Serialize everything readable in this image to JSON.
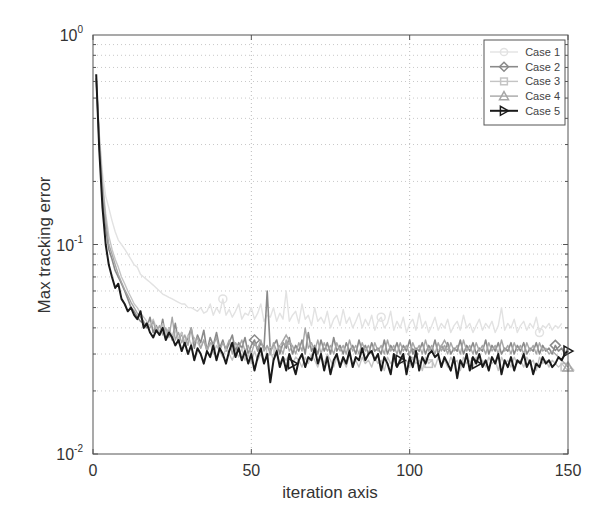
{
  "chart_data": {
    "type": "line",
    "title": "",
    "xlabel": "iteration axis",
    "ylabel": "Max tracking error",
    "xlim": [
      0,
      150
    ],
    "ylim": [
      0.01,
      1
    ],
    "yscale": "log",
    "grid": true,
    "legend_position": "upper right",
    "x_ticks": [
      0,
      50,
      100,
      150
    ],
    "x_tick_labels": [
      "0",
      "50",
      "100",
      "150"
    ],
    "y_ticks": [
      0.01,
      0.1,
      1
    ],
    "y_tick_labels": [
      {
        "base": "10",
        "exp": "-2"
      },
      {
        "base": "10",
        "exp": "-1"
      },
      {
        "base": "10",
        "exp": "0"
      }
    ],
    "legend": [
      "Case 1",
      "Case 2",
      "Case 3",
      "Case 4",
      "Case 5"
    ],
    "series": [
      {
        "name": "Case 1",
        "color": "#e2e2e2",
        "marker": "circle",
        "width": 1.4,
        "values": [
          0.62,
          0.34,
          0.22,
          0.17,
          0.15,
          0.13,
          0.115,
          0.105,
          0.1,
          0.095,
          0.09,
          0.085,
          0.08,
          0.078,
          0.072,
          0.07,
          0.068,
          0.066,
          0.064,
          0.062,
          0.06,
          0.058,
          0.057,
          0.056,
          0.055,
          0.054,
          0.053,
          0.052,
          0.052,
          0.05,
          0.05,
          0.049,
          0.048,
          0.05,
          0.047,
          0.048,
          0.052,
          0.046,
          0.05,
          0.047,
          0.055,
          0.046,
          0.049,
          0.045,
          0.048,
          0.052,
          0.044,
          0.047,
          0.046,
          0.05,
          0.044,
          0.047,
          0.052,
          0.043,
          0.046,
          0.045,
          0.05,
          0.043,
          0.047,
          0.044,
          0.06,
          0.043,
          0.046,
          0.048,
          0.042,
          0.052,
          0.044,
          0.046,
          0.041,
          0.05,
          0.043,
          0.045,
          0.042,
          0.048,
          0.04,
          0.044,
          0.046,
          0.041,
          0.049,
          0.042,
          0.045,
          0.04,
          0.043,
          0.047,
          0.04,
          0.044,
          0.041,
          0.046,
          0.039,
          0.043,
          0.045,
          0.04,
          0.042,
          0.048,
          0.039,
          0.043,
          0.04,
          0.045,
          0.038,
          0.042,
          0.044,
          0.039,
          0.047,
          0.04,
          0.043,
          0.038,
          0.041,
          0.045,
          0.039,
          0.042,
          0.04,
          0.044,
          0.038,
          0.041,
          0.043,
          0.039,
          0.046,
          0.04,
          0.042,
          0.038,
          0.041,
          0.044,
          0.039,
          0.042,
          0.04,
          0.043,
          0.038,
          0.041,
          0.05,
          0.039,
          0.042,
          0.04,
          0.044,
          0.038,
          0.041,
          0.043,
          0.039,
          0.042,
          0.04,
          0.045,
          0.038,
          0.041,
          0.04,
          0.042,
          0.039,
          0.041,
          0.04,
          0.042
        ]
      },
      {
        "name": "Case 2",
        "color": "#8a8a8a",
        "marker": "diamond",
        "width": 1.6,
        "values": [
          0.62,
          0.3,
          0.17,
          0.12,
          0.095,
          0.085,
          0.075,
          0.07,
          0.065,
          0.06,
          0.055,
          0.05,
          0.048,
          0.045,
          0.043,
          0.042,
          0.04,
          0.045,
          0.038,
          0.041,
          0.037,
          0.044,
          0.036,
          0.04,
          0.035,
          0.042,
          0.034,
          0.038,
          0.033,
          0.036,
          0.04,
          0.032,
          0.037,
          0.034,
          0.039,
          0.031,
          0.036,
          0.033,
          0.038,
          0.032,
          0.035,
          0.031,
          0.034,
          0.037,
          0.031,
          0.034,
          0.032,
          0.036,
          0.03,
          0.033,
          0.035,
          0.031,
          0.034,
          0.032,
          0.06,
          0.031,
          0.033,
          0.035,
          0.03,
          0.034,
          0.032,
          0.036,
          0.03,
          0.033,
          0.031,
          0.035,
          0.03,
          0.038,
          0.031,
          0.033,
          0.03,
          0.035,
          0.031,
          0.034,
          0.03,
          0.036,
          0.031,
          0.033,
          0.03,
          0.034,
          0.031,
          0.033,
          0.03,
          0.035,
          0.031,
          0.033,
          0.03,
          0.034,
          0.031,
          0.032,
          0.03,
          0.035,
          0.03,
          0.033,
          0.031,
          0.034,
          0.03,
          0.033,
          0.031,
          0.035,
          0.03,
          0.032,
          0.031,
          0.034,
          0.03,
          0.033,
          0.031,
          0.035,
          0.03,
          0.033,
          0.031,
          0.034,
          0.03,
          0.032,
          0.031,
          0.035,
          0.03,
          0.033,
          0.031,
          0.034,
          0.03,
          0.032,
          0.031,
          0.035,
          0.03,
          0.033,
          0.031,
          0.034,
          0.03,
          0.032,
          0.031,
          0.034,
          0.03,
          0.033,
          0.031,
          0.034,
          0.03,
          0.032,
          0.031,
          0.034,
          0.03,
          0.033,
          0.031,
          0.032,
          0.03,
          0.033,
          0.031,
          0.032,
          0.03,
          0.032
        ]
      },
      {
        "name": "Case 3",
        "color": "#c4c4c4",
        "marker": "square",
        "width": 1.4,
        "values": [
          0.62,
          0.33,
          0.2,
          0.14,
          0.11,
          0.095,
          0.085,
          0.078,
          0.07,
          0.065,
          0.06,
          0.056,
          0.052,
          0.05,
          0.047,
          0.045,
          0.043,
          0.041,
          0.044,
          0.04,
          0.038,
          0.042,
          0.037,
          0.04,
          0.036,
          0.039,
          0.035,
          0.038,
          0.034,
          0.037,
          0.033,
          0.036,
          0.034,
          0.032,
          0.035,
          0.031,
          0.034,
          0.03,
          0.033,
          0.031,
          0.029,
          0.032,
          0.03,
          0.028,
          0.031,
          0.029,
          0.032,
          0.028,
          0.03,
          0.027,
          0.031,
          0.028,
          0.03,
          0.027,
          0.029,
          0.031,
          0.028,
          0.03,
          0.027,
          0.029,
          0.028,
          0.03,
          0.027,
          0.029,
          0.028,
          0.026,
          0.029,
          0.027,
          0.03,
          0.028,
          0.026,
          0.029,
          0.027,
          0.03,
          0.028,
          0.026,
          0.029,
          0.027,
          0.028,
          0.026,
          0.03,
          0.027,
          0.028,
          0.026,
          0.029,
          0.027,
          0.028,
          0.026,
          0.029,
          0.027,
          0.028,
          0.025,
          0.029,
          0.027,
          0.028,
          0.026,
          0.029,
          0.027,
          0.028,
          0.026,
          0.029,
          0.027,
          0.028,
          0.025,
          0.029,
          0.027,
          0.028,
          0.026,
          0.029,
          0.027,
          0.028,
          0.026,
          0.029,
          0.027,
          0.028,
          0.025,
          0.029,
          0.027,
          0.028,
          0.026,
          0.029,
          0.027,
          0.028,
          0.026,
          0.029,
          0.027,
          0.028,
          0.025,
          0.029,
          0.027,
          0.028,
          0.026,
          0.029,
          0.027,
          0.028,
          0.026,
          0.029,
          0.027,
          0.028,
          0.025,
          0.029,
          0.027,
          0.028,
          0.026,
          0.028,
          0.027,
          0.026,
          0.027,
          0.026,
          0.025,
          0.026,
          0.025
        ]
      },
      {
        "name": "Case 4",
        "color": "#a6a6a6",
        "marker": "triangle-up",
        "width": 1.4,
        "values": [
          0.62,
          0.31,
          0.19,
          0.13,
          0.1,
          0.09,
          0.08,
          0.072,
          0.066,
          0.061,
          0.057,
          0.053,
          0.05,
          0.047,
          0.045,
          0.043,
          0.041,
          0.04,
          0.043,
          0.038,
          0.041,
          0.037,
          0.04,
          0.036,
          0.045,
          0.035,
          0.038,
          0.034,
          0.037,
          0.033,
          0.04,
          0.034,
          0.036,
          0.032,
          0.035,
          0.031,
          0.034,
          0.033,
          0.036,
          0.031,
          0.034,
          0.032,
          0.035,
          0.03,
          0.034,
          0.032,
          0.035,
          0.031,
          0.033,
          0.03,
          0.034,
          0.032,
          0.035,
          0.031,
          0.033,
          0.03,
          0.034,
          0.031,
          0.033,
          0.03,
          0.035,
          0.031,
          0.033,
          0.03,
          0.034,
          0.031,
          0.04,
          0.032,
          0.034,
          0.031,
          0.035,
          0.03,
          0.034,
          0.031,
          0.033,
          0.03,
          0.034,
          0.031,
          0.033,
          0.03,
          0.035,
          0.031,
          0.033,
          0.03,
          0.034,
          0.031,
          0.033,
          0.03,
          0.034,
          0.031,
          0.033,
          0.03,
          0.035,
          0.031,
          0.033,
          0.03,
          0.034,
          0.031,
          0.033,
          0.03,
          0.034,
          0.031,
          0.033,
          0.03,
          0.035,
          0.031,
          0.033,
          0.03,
          0.034,
          0.031,
          0.033,
          0.03,
          0.034,
          0.031,
          0.033,
          0.03,
          0.035,
          0.031,
          0.033,
          0.03,
          0.034,
          0.031,
          0.033,
          0.03,
          0.034,
          0.031,
          0.033,
          0.03,
          0.035,
          0.031,
          0.033,
          0.03,
          0.034,
          0.031,
          0.033,
          0.03,
          0.034,
          0.031,
          0.033,
          0.03,
          0.034,
          0.031,
          0.032,
          0.03,
          0.031,
          0.03,
          0.029,
          0.028,
          0.027,
          0.026
        ]
      },
      {
        "name": "Case 5",
        "color": "#1a1a1a",
        "marker": "triangle-right",
        "width": 2.0,
        "values": [
          0.65,
          0.28,
          0.15,
          0.1,
          0.08,
          0.07,
          0.062,
          0.065,
          0.055,
          0.052,
          0.048,
          0.05,
          0.046,
          0.044,
          0.048,
          0.04,
          0.042,
          0.038,
          0.036,
          0.039,
          0.037,
          0.04,
          0.035,
          0.038,
          0.036,
          0.033,
          0.035,
          0.031,
          0.034,
          0.03,
          0.033,
          0.028,
          0.032,
          0.03,
          0.027,
          0.031,
          0.029,
          0.033,
          0.028,
          0.032,
          0.03,
          0.027,
          0.031,
          0.034,
          0.029,
          0.032,
          0.028,
          0.031,
          0.027,
          0.03,
          0.025,
          0.029,
          0.032,
          0.027,
          0.03,
          0.022,
          0.028,
          0.031,
          0.026,
          0.029,
          0.025,
          0.03,
          0.027,
          0.024,
          0.028,
          0.03,
          0.026,
          0.029,
          0.028,
          0.032,
          0.027,
          0.03,
          0.025,
          0.029,
          0.024,
          0.028,
          0.03,
          0.026,
          0.029,
          0.027,
          0.031,
          0.026,
          0.029,
          0.028,
          0.032,
          0.028,
          0.03,
          0.031,
          0.028,
          0.03,
          0.025,
          0.029,
          0.027,
          0.024,
          0.03,
          0.026,
          0.028,
          0.03,
          0.024,
          0.029,
          0.026,
          0.031,
          0.025,
          0.029,
          0.027,
          0.03,
          0.031,
          0.029,
          0.03,
          0.026,
          0.029,
          0.027,
          0.025,
          0.029,
          0.023,
          0.028,
          0.026,
          0.03,
          0.025,
          0.029,
          0.027,
          0.03,
          0.026,
          0.028,
          0.025,
          0.029,
          0.027,
          0.03,
          0.024,
          0.028,
          0.026,
          0.029,
          0.025,
          0.028,
          0.027,
          0.03,
          0.026,
          0.028,
          0.024,
          0.027,
          0.026,
          0.029,
          0.027,
          0.028,
          0.026,
          0.027,
          0.029,
          0.028,
          0.03,
          0.031
        ]
      }
    ]
  }
}
